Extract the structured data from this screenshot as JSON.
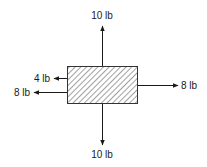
{
  "diagram": {
    "type": "free-body-diagram",
    "body": {
      "shape": "rectangle",
      "fill": "hatched"
    },
    "forces": [
      {
        "id": "up",
        "label": "10 lb",
        "direction": "up",
        "magnitude": 10,
        "unit": "lb"
      },
      {
        "id": "down",
        "label": "10 lb",
        "direction": "down",
        "magnitude": 10,
        "unit": "lb"
      },
      {
        "id": "right",
        "label": "8 lb",
        "direction": "right",
        "magnitude": 8,
        "unit": "lb"
      },
      {
        "id": "left-upper",
        "label": "4 lb",
        "direction": "left",
        "magnitude": 4,
        "unit": "lb"
      },
      {
        "id": "left-lower",
        "label": "8 lb",
        "direction": "left",
        "magnitude": 8,
        "unit": "lb"
      }
    ],
    "colors": {
      "stroke": "#1a1a1a",
      "hatch": "#444444",
      "background": "#ffffff"
    }
  }
}
